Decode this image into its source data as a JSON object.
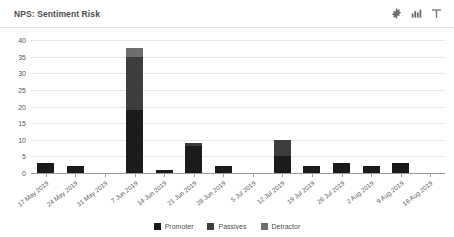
{
  "header": {
    "title": "NPS: Sentiment Risk",
    "tools": [
      {
        "name": "settings-icon",
        "label": "Settings"
      },
      {
        "name": "bar-chart-icon",
        "label": "Chart type"
      },
      {
        "name": "filter-icon",
        "label": "Filter"
      }
    ]
  },
  "chart_data": {
    "type": "bar",
    "stacked": true,
    "title": "NPS: Sentiment Risk",
    "xlabel": "",
    "ylabel": "",
    "ylim": [
      0,
      40
    ],
    "ytick_step": 5,
    "yticks": [
      40,
      35,
      30,
      25,
      20,
      15,
      10,
      5,
      0
    ],
    "grid": true,
    "legend_position": "bottom",
    "categories": [
      "17 May 2019",
      "24 May 2019",
      "31 May 2019",
      "7 Jun 2019",
      "14 Jun 2019",
      "21 Jun 2019",
      "28 Jun 2019",
      "5 Jul 2019",
      "12 Jul 2019",
      "19 Jul 2019",
      "26 Jul 2019",
      "2 Aug 2019",
      "9 Aug 2019",
      "16 Aug 2019"
    ],
    "series": [
      {
        "name": "Promoter",
        "color": "#1b1b1b",
        "values": [
          3,
          2,
          0,
          19,
          1,
          8,
          2,
          0,
          5,
          2,
          3,
          2,
          3,
          0
        ]
      },
      {
        "name": "Passives",
        "color": "#3d3d3d",
        "values": [
          0,
          0,
          0,
          16,
          0,
          1,
          0,
          0,
          5,
          0,
          0,
          0,
          0,
          0
        ]
      },
      {
        "name": "Detractor",
        "color": "#6e6e6e",
        "values": [
          0,
          0,
          0,
          2.5,
          0,
          0,
          0,
          0,
          0,
          0,
          0,
          0,
          0,
          0
        ]
      }
    ],
    "totals": [
      3,
      2,
      0,
      37.5,
      1,
      9,
      2,
      0,
      10,
      2,
      3,
      2,
      3,
      0
    ]
  }
}
